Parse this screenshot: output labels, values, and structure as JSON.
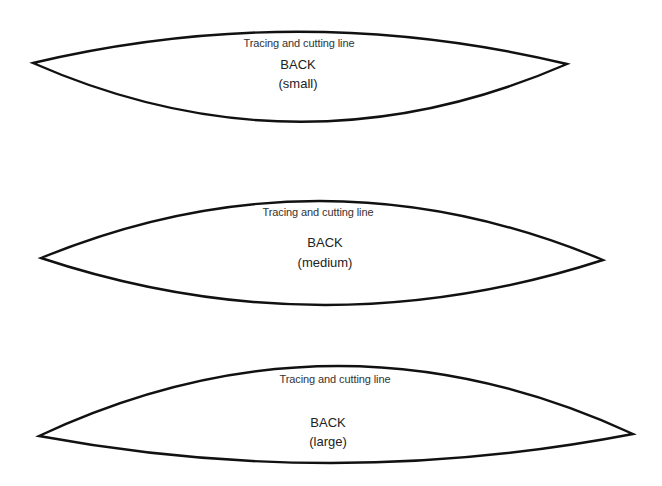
{
  "pattern_pieces": [
    {
      "id": "back-small",
      "trace_label": "Tracing and cutting line",
      "title": "BACK",
      "size": "(small)",
      "outline": {
        "left_tip": [
          33,
          63
        ],
        "right_tip": [
          567,
          64
        ],
        "top_extreme_y": 32,
        "bottom_extreme_y": 121
      }
    },
    {
      "id": "back-medium",
      "trace_label": "Tracing and cutting line",
      "title": "BACK",
      "size": "(medium)",
      "outline": {
        "left_tip": [
          41,
          258
        ],
        "right_tip": [
          603,
          260
        ],
        "top_extreme_y": 201,
        "bottom_extreme_y": 305
      }
    },
    {
      "id": "back-large",
      "trace_label": "Tracing and cutting line",
      "title": "BACK",
      "size": "(large)",
      "outline": {
        "left_tip": [
          39,
          436
        ],
        "right_tip": [
          633,
          434
        ],
        "top_extreme_y": 366,
        "bottom_extreme_y": 463
      }
    }
  ],
  "colors": {
    "background": "#ffffff",
    "outline_stroke": "#111111",
    "text": "#2a2a2a"
  }
}
